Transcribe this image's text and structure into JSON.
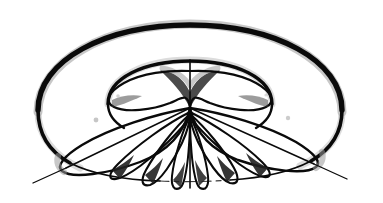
{
  "figure": {
    "title": "Three-dimensional multi-lobe radiation pattern",
    "kind": "line-drawing",
    "medium": "scanned ink line drawing",
    "background_color": "#ffffff",
    "ink_color": "#0a0a0a",
    "halo_color": "#9a9a9a",
    "canvas": {
      "width": 383,
      "height": 203
    },
    "symmetry": "bilateral about vertical axis",
    "center_point": {
      "x": 190,
      "y": 108
    },
    "apex_point": {
      "x": 190,
      "y": 71
    }
  },
  "geometry": {
    "outer_ellipse": {
      "name": "outer envelope ellipse",
      "cx": 190,
      "cy": 103,
      "rx": 152,
      "ry": 78,
      "stroke_width_top": 5.2,
      "stroke_width_bottom": 1.1
    },
    "inner_ellipse": {
      "name": "inner envelope ellipse",
      "cx": 190,
      "cy": 103,
      "rx": 82,
      "ry": 42,
      "stroke_width_top": 3.6,
      "stroke_width_bottom": 1.0
    },
    "vertical_axis": {
      "name": "vertical axis line",
      "x": 190,
      "y_top": 60,
      "y_bottom": 188,
      "stroke_width": 1.5
    },
    "major_axis_left": {
      "name": "left slant axis line",
      "x1": 190,
      "y1": 108,
      "x2": 33,
      "y2": 182,
      "stroke_width": 1.4
    },
    "major_axis_right": {
      "name": "right slant axis line",
      "x1": 190,
      "y1": 108,
      "x2": 347,
      "y2": 178,
      "stroke_width": 1.4
    }
  },
  "lobes": {
    "upper_left": {
      "name": "upper-left main lobe",
      "tip": {
        "x": 104,
        "y": 88
      },
      "note": "broad lobe sweeping left from apex, looping back to centre"
    },
    "upper_right": {
      "name": "upper-right main lobe",
      "tip": {
        "x": 276,
        "y": 88
      },
      "note": "mirror of upper-left lobe"
    },
    "lower_left_major": {
      "name": "lower-left major lobe",
      "tip": {
        "x": 58,
        "y": 166
      },
      "note": "longest lobe, tip pierces the outer ellipse"
    },
    "lower_right_major": {
      "name": "lower-right major lobe",
      "tip": {
        "x": 322,
        "y": 162
      },
      "note": "mirror of lower-left major lobe"
    },
    "minor_petals_left": [
      {
        "name": "left petal 1",
        "tip": {
          "x": 113,
          "y": 180
        }
      },
      {
        "name": "left petal 2",
        "tip": {
          "x": 144,
          "y": 186
        }
      },
      {
        "name": "left petal 3",
        "tip": {
          "x": 171,
          "y": 189
        }
      }
    ],
    "minor_petals_right": [
      {
        "name": "right petal 1",
        "tip": {
          "x": 267,
          "y": 178
        }
      },
      {
        "name": "right petal 2",
        "tip": {
          "x": 236,
          "y": 185
        }
      },
      {
        "name": "right petal 3",
        "tip": {
          "x": 209,
          "y": 189
        }
      }
    ],
    "petal_count_total": 10
  },
  "shading": {
    "apex_wedge": "dark triangular wedge beneath the apex cusp",
    "petal_roots": "dark triangular gussets where minor petals meet the major lobe edges",
    "outer_rim": "heavy ink on the upper rim fading to hairline at the lower rim"
  },
  "labels": {
    "has_text_labels": false,
    "has_axis_ticks": false,
    "has_legend": false,
    "visible_text": ""
  }
}
